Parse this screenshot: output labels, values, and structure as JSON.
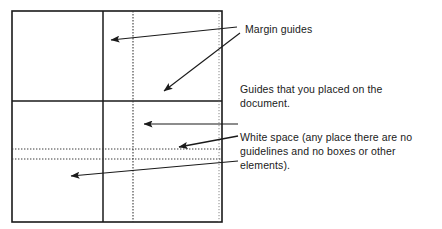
{
  "figure": {
    "type": "page-layout-guides-diagram",
    "background_color": "#ffffff",
    "line_color": "#1a1a1a",
    "guide_color": "#3a3a3a"
  },
  "page_box": {
    "label": "document-page",
    "x": 12,
    "y": 11,
    "width": 210,
    "height": 211
  },
  "margin_guides": [
    {
      "name": "vertical-margin-guide",
      "orientation": "vertical",
      "position": 103
    },
    {
      "name": "horizontal-margin-guide",
      "orientation": "horizontal",
      "position": 101
    }
  ],
  "user_guides": [
    {
      "name": "vertical-user-guide",
      "orientation": "vertical",
      "position": 133
    },
    {
      "name": "horizontal-user-guide-upper",
      "orientation": "horizontal",
      "position": 149
    },
    {
      "name": "horizontal-user-guide-lower",
      "orientation": "horizontal",
      "position": 159
    }
  ],
  "arrows": [
    {
      "name": "arrow-to-margin-guide-vertical",
      "from": [
        237,
        27
      ],
      "to": [
        110,
        40
      ]
    },
    {
      "name": "arrow-to-margin-guide-horizontal",
      "from": [
        240,
        33
      ],
      "to": [
        163,
        92
      ]
    },
    {
      "name": "arrow-to-user-guide-vertical",
      "from": [
        238,
        124
      ],
      "to": [
        143,
        124
      ]
    },
    {
      "name": "arrow-to-user-guide-horizontal",
      "from": [
        238,
        136
      ],
      "to": [
        178,
        147
      ]
    },
    {
      "name": "arrow-to-white-space",
      "from": [
        238,
        161
      ],
      "to": [
        70,
        176
      ]
    }
  ],
  "callouts": {
    "margin_guides": "Margin guides",
    "placed_guides": "Guides that you placed on the\ndocument.",
    "white_space": "White space (any place there are no\nguidelines and no boxes or other\nelements)."
  }
}
